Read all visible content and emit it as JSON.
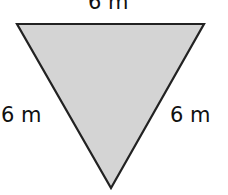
{
  "diagram": {
    "shape": "inverted equilateral triangle",
    "fill_color": "#d4d4d4",
    "stroke_color": "#222222",
    "labels": {
      "top": "6 m",
      "left": "6 m",
      "right": "6 m"
    }
  }
}
